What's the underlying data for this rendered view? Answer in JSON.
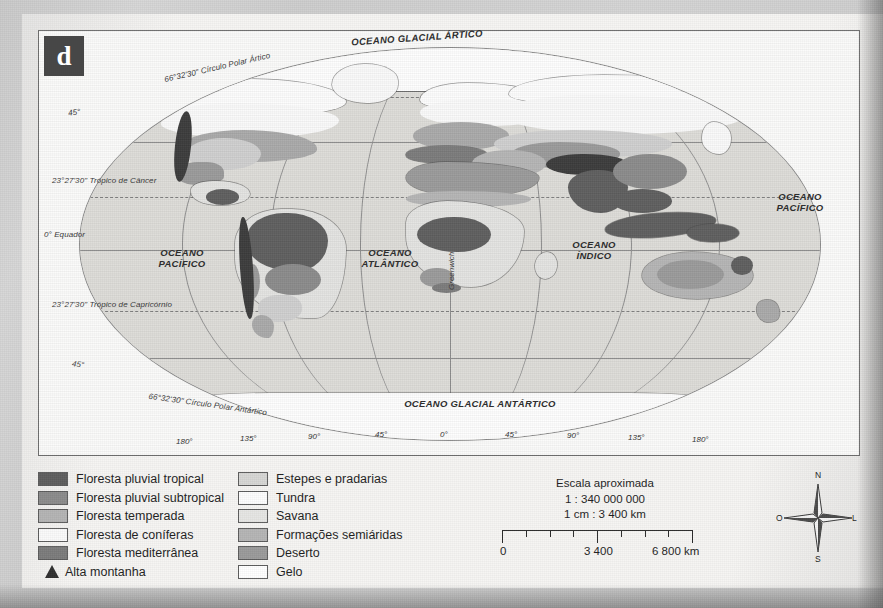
{
  "credit": "França da Silva",
  "panel": {
    "letter": "d"
  },
  "map": {
    "ocean_labels": [
      {
        "text": "OCEANO GLACIAL ÁRTICO",
        "x": 417,
        "y": 33,
        "rot": -4
      },
      {
        "text": "OCEANO\nPACÍFICO",
        "x": 182,
        "y": 248,
        "rot": 0
      },
      {
        "text": "OCEANO\nATLÂNTICO",
        "x": 390,
        "y": 248,
        "rot": 0
      },
      {
        "text": "OCEANO\nÍNDICO",
        "x": 594,
        "y": 240,
        "rot": 0
      },
      {
        "text": "OCEANO\nPACÍFICO",
        "x": 800,
        "y": 192,
        "rot": 0
      },
      {
        "text": "OCEANO GLACIAL ANTÁRTICO",
        "x": 480,
        "y": 399,
        "rot": 0
      }
    ],
    "graticule_labels": [
      {
        "text": "66°32'30\" Círculo Polar Ártico",
        "x": 163,
        "y": 63,
        "rot": -13
      },
      {
        "text": "45°",
        "x": 68,
        "y": 108,
        "rot": -8
      },
      {
        "text": "23°27'30\" Trópico de Câncer",
        "x": 52,
        "y": 176,
        "rot": 0
      },
      {
        "text": "0° Equador",
        "x": 44,
        "y": 230,
        "rot": 0
      },
      {
        "text": "23°27'30\" Trópico de Capricórnio",
        "x": 52,
        "y": 300,
        "rot": 0
      },
      {
        "text": "45°",
        "x": 72,
        "y": 360,
        "rot": 6
      },
      {
        "text": "66°32'30\" Círculo Polar Antártico",
        "x": 148,
        "y": 400,
        "rot": 8
      }
    ],
    "greenwich_label": "Greenwich",
    "longitude_ticks": [
      {
        "label": "180°",
        "x": 176,
        "y": 437
      },
      {
        "label": "135°",
        "x": 240,
        "y": 434
      },
      {
        "label": "90°",
        "x": 308,
        "y": 432
      },
      {
        "label": "45°",
        "x": 375,
        "y": 430
      },
      {
        "label": "0°",
        "x": 440,
        "y": 430
      },
      {
        "label": "45°",
        "x": 505,
        "y": 430
      },
      {
        "label": "90°",
        "x": 567,
        "y": 431
      },
      {
        "label": "135°",
        "x": 628,
        "y": 433
      },
      {
        "label": "180°",
        "x": 692,
        "y": 435
      }
    ]
  },
  "legend": {
    "left_column": [
      {
        "label": "Floresta pluvial tropical",
        "color": "#5e5e5e",
        "shape": "box"
      },
      {
        "label": "Floresta pluvial subtropical",
        "color": "#8b8b8b",
        "shape": "box"
      },
      {
        "label": "Floresta temperada",
        "color": "#b4b4b4",
        "shape": "box"
      },
      {
        "label": "Floresta de coníferas",
        "color": "#fafafa",
        "shape": "box"
      },
      {
        "label": "Floresta mediterrânea",
        "color": "#7b7b7b",
        "shape": "box"
      },
      {
        "label": "Alta montanha",
        "color": "#2f2f2f",
        "shape": "triangle"
      }
    ],
    "right_column": [
      {
        "label": "Estepes e pradarias",
        "color": "#d6d6d4",
        "shape": "box"
      },
      {
        "label": "Tundra",
        "color": "#fdfdfd",
        "shape": "box"
      },
      {
        "label": "Savana",
        "color": "#e6e6e3",
        "shape": "box"
      },
      {
        "label": "Formações semiáridas",
        "color": "#b5b5b5",
        "shape": "box"
      },
      {
        "label": "Deserto",
        "color": "#9a9a9a",
        "shape": "box"
      },
      {
        "label": "Gelo",
        "color": "#ffffff",
        "shape": "box"
      }
    ]
  },
  "scale": {
    "title": "Escala aproximada",
    "ratio": "1 : 340 000 000",
    "equivalence": "1 cm : 3 400 km",
    "bar_labels": [
      {
        "text": "0",
        "x": 0
      },
      {
        "text": "3 400",
        "x": 84
      },
      {
        "text": "6 800 km",
        "x": 152
      }
    ]
  },
  "compass": {
    "north": "N",
    "south": "S",
    "east": "L",
    "west": "O"
  }
}
